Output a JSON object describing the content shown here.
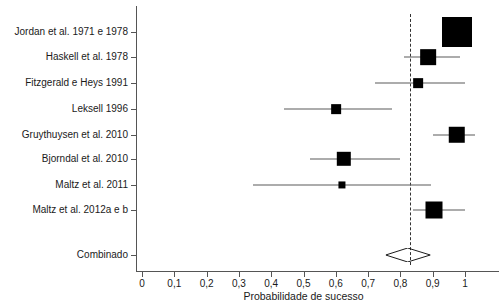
{
  "chart_data": {
    "type": "forest",
    "title": "",
    "xlabel": "Probabilidade de sucesso",
    "ylabel": "",
    "xlim": [
      0,
      1
    ],
    "xticks": [
      0,
      0.1,
      0.2,
      0.3,
      0.4,
      0.5,
      0.6,
      0.7,
      0.8,
      0.9,
      1
    ],
    "xticklabels": [
      "0",
      "0,1",
      "0,2",
      "0,3",
      "0,4",
      "0,5",
      "0,6",
      "0,7",
      "0,8",
      "0,9",
      "1"
    ],
    "grid": false,
    "legend": "none",
    "reference_line": 0.83,
    "marker_color": "#000000",
    "line_color": "#5a5a5a",
    "studies": [
      {
        "label": "Jordan et al. 1971 e 1978",
        "estimate": 0.975,
        "ci_low": 0.955,
        "ci_high": 1.0,
        "weight": 1.0
      },
      {
        "label": "Haskell et al. 1978",
        "estimate": 0.885,
        "ci_low": 0.81,
        "ci_high": 0.985,
        "weight": 0.45
      },
      {
        "label": "Fitzgerald e Heys 1991",
        "estimate": 0.855,
        "ci_low": 0.72,
        "ci_high": 1.0,
        "weight": 0.22
      },
      {
        "label": "Leksell 1996",
        "estimate": 0.6,
        "ci_low": 0.44,
        "ci_high": 0.775,
        "weight": 0.22
      },
      {
        "label": "Gruythuysen et al. 2010",
        "estimate": 0.975,
        "ci_low": 0.9,
        "ci_high": 1.03,
        "weight": 0.48
      },
      {
        "label": "Bjorndal et al. 2010",
        "estimate": 0.625,
        "ci_low": 0.52,
        "ci_high": 0.8,
        "weight": 0.4
      },
      {
        "label": "Maltz et al. 2011",
        "estimate": 0.62,
        "ci_low": 0.345,
        "ci_high": 0.895,
        "weight": 0.12
      },
      {
        "label": "Maltz et al. 2012a e b",
        "estimate": 0.905,
        "ci_low": 0.84,
        "ci_high": 1.0,
        "weight": 0.5
      }
    ],
    "summary": {
      "label": "Combinado",
      "estimate": 0.825,
      "ci_low": 0.757,
      "ci_high": 0.895
    }
  }
}
